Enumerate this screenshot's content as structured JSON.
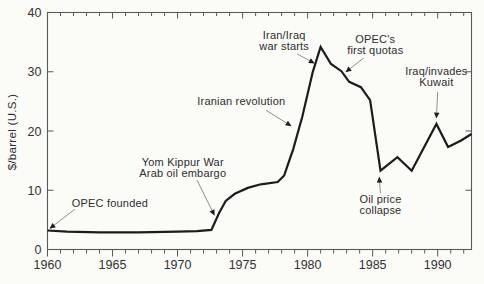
{
  "figure": {
    "background": "#fbfbf8",
    "frame_color": "#5a5a5a",
    "line_color": "#1c1c1c",
    "arrow_shaft_color": "#8f8f8f",
    "text_color": "#2e2e2e",
    "tick_label_color": "#333333"
  },
  "chart_data": {
    "type": "line",
    "title": "",
    "xlabel": "",
    "ylabel": "$/barrel (U.S.)",
    "xlim": [
      1960,
      1992.6
    ],
    "ylim": [
      0,
      40
    ],
    "grid": false,
    "legend": "none",
    "x_ticks_labeled": [
      1960,
      1965,
      1970,
      1975,
      1980,
      1985,
      1990
    ],
    "x_tick_labels": [
      "1960",
      "1965",
      "1970",
      "1975",
      "1980",
      "1985",
      "1990"
    ],
    "x_minor_tick_interval": 1,
    "y_ticks_labeled": [
      0,
      10,
      20,
      30,
      40
    ],
    "y_tick_labels": [
      "0",
      "10",
      "20",
      "30",
      "40"
    ],
    "series": [
      {
        "name": "crude-oil-price",
        "points": [
          [
            1960.0,
            3.2
          ],
          [
            1961.5,
            3.0
          ],
          [
            1964.0,
            2.9
          ],
          [
            1967.0,
            2.9
          ],
          [
            1970.0,
            3.0
          ],
          [
            1971.5,
            3.1
          ],
          [
            1972.6,
            3.3
          ],
          [
            1973.2,
            6.2
          ],
          [
            1973.7,
            8.2
          ],
          [
            1974.4,
            9.4
          ],
          [
            1975.4,
            10.4
          ],
          [
            1976.4,
            11.0
          ],
          [
            1977.7,
            11.4
          ],
          [
            1978.2,
            12.5
          ],
          [
            1978.9,
            17.0
          ],
          [
            1979.6,
            22.5
          ],
          [
            1980.4,
            30.0
          ],
          [
            1981.0,
            34.2
          ],
          [
            1981.8,
            31.3
          ],
          [
            1982.6,
            30.1
          ],
          [
            1983.2,
            28.3
          ],
          [
            1984.1,
            27.4
          ],
          [
            1984.8,
            25.2
          ],
          [
            1985.6,
            13.3
          ],
          [
            1986.9,
            15.6
          ],
          [
            1988.0,
            13.3
          ],
          [
            1989.9,
            21.2
          ],
          [
            1990.8,
            17.3
          ],
          [
            1991.8,
            18.4
          ],
          [
            1992.6,
            19.5
          ]
        ]
      }
    ],
    "annotations": [
      {
        "id": "opec-founded",
        "lines": [
          "OPEC founded"
        ],
        "text_at": [
          1964.8,
          7.9
        ],
        "arrow_from": [
          1962.1,
          6.8
        ],
        "arrow_to": [
          1960.15,
          3.5
        ]
      },
      {
        "id": "yom-kippur",
        "lines": [
          "Yom Kippur War",
          "Arab oil embargo"
        ],
        "text_at": [
          1970.4,
          13.9
        ],
        "arrow_from": [
          1971.5,
          11.7
        ],
        "arrow_to": [
          1972.85,
          5.7
        ]
      },
      {
        "id": "iranian-revolution",
        "lines": [
          "Iranian revolution"
        ],
        "text_at": [
          1974.9,
          25.1
        ],
        "arrow_from": [
          1976.8,
          23.5
        ],
        "arrow_to": [
          1978.77,
          20.8
        ]
      },
      {
        "id": "iran-iraq-war",
        "lines": [
          "Iran/Iraq",
          "war starts"
        ],
        "text_at": [
          1978.2,
          35.2
        ],
        "arrow_from": [
          1979.2,
          33.0
        ],
        "arrow_to": [
          1980.55,
          31.4
        ]
      },
      {
        "id": "opec-first-quotas",
        "lines": [
          "OPEC's",
          "first quotas"
        ],
        "text_at": [
          1985.2,
          34.6
        ],
        "arrow_from": [
          1984.3,
          32.3
        ],
        "arrow_to": [
          1982.9,
          29.9
        ]
      },
      {
        "id": "iraq-invades-kuwait",
        "lines": [
          "Iraq/invades",
          "Kuwait"
        ],
        "text_at": [
          1989.9,
          29.2
        ],
        "arrow_from": [
          1990.0,
          26.6
        ],
        "arrow_to": [
          1989.9,
          22.1
        ]
      },
      {
        "id": "oil-price-collapse",
        "lines": [
          "Oil price",
          "collapse"
        ],
        "text_at": [
          1985.6,
          7.6
        ],
        "arrow_from": [
          1985.6,
          9.5
        ],
        "arrow_to": [
          1985.5,
          12.3
        ]
      }
    ]
  }
}
